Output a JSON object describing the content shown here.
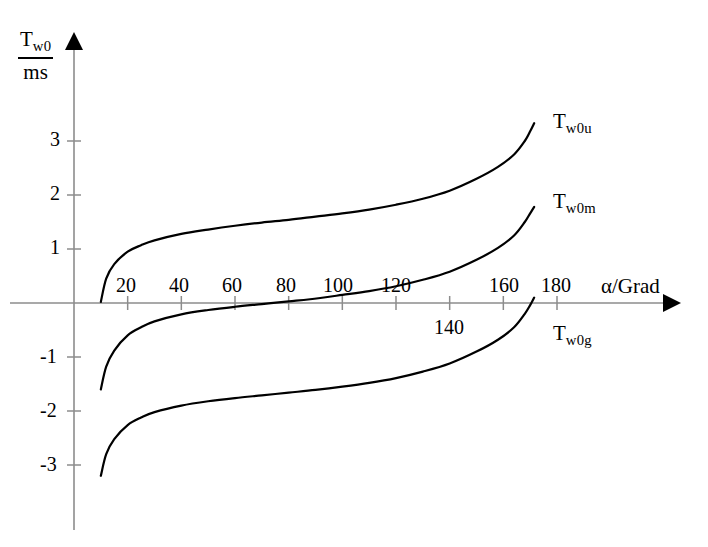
{
  "chart_data": {
    "type": "line",
    "title": "",
    "xlabel": "α/Grad",
    "ylabel_numerator": "T",
    "ylabel_numerator_sub": "w0",
    "ylabel_denominator": "ms",
    "ylabel": "T_w0 / ms",
    "xlim": [
      0,
      190
    ],
    "ylim": [
      -3.6,
      3.8
    ],
    "grid": false,
    "legend_position": "right-inline",
    "x_ticks": [
      20,
      40,
      60,
      80,
      100,
      120,
      140,
      160,
      180
    ],
    "x_tick_labels": [
      "20",
      "40",
      "60",
      "80",
      "100",
      "120",
      "140",
      "160",
      "180"
    ],
    "x_tick_label_below_axis": [
      false,
      false,
      false,
      false,
      false,
      false,
      true,
      false,
      false
    ],
    "y_ticks": [
      3,
      2,
      1,
      -1,
      -2,
      -3
    ],
    "y_tick_labels": [
      "3",
      "2",
      "1",
      "-1",
      "-2",
      "-3"
    ],
    "series": [
      {
        "name": "T_w0u",
        "label_base": "T",
        "label_sub": "w0u",
        "color": "#000000",
        "x": [
          10,
          12,
          15,
          20,
          25,
          30,
          40,
          50,
          60,
          70,
          80,
          90,
          100,
          110,
          120,
          130,
          140,
          150,
          158,
          164,
          168,
          170,
          171.5
        ],
        "y": [
          0.02,
          0.45,
          0.72,
          0.95,
          1.07,
          1.16,
          1.28,
          1.36,
          1.43,
          1.49,
          1.54,
          1.6,
          1.66,
          1.73,
          1.82,
          1.93,
          2.08,
          2.3,
          2.52,
          2.75,
          3.0,
          3.18,
          3.33
        ]
      },
      {
        "name": "T_w0m",
        "label_base": "T",
        "label_sub": "w0m",
        "color": "#000000",
        "x": [
          10,
          12,
          15,
          20,
          25,
          30,
          40,
          50,
          60,
          70,
          80,
          88,
          100,
          110,
          120,
          130,
          140,
          150,
          158,
          164,
          168,
          170,
          171.5
        ],
        "y": [
          -1.6,
          -1.18,
          -0.88,
          -0.6,
          -0.45,
          -0.34,
          -0.21,
          -0.13,
          -0.07,
          -0.02,
          0.03,
          0.07,
          0.15,
          0.22,
          0.31,
          0.43,
          0.58,
          0.8,
          1.02,
          1.25,
          1.5,
          1.66,
          1.78
        ]
      },
      {
        "name": "T_w0g",
        "label_base": "T",
        "label_sub": "w0g",
        "color": "#000000",
        "x": [
          10,
          12,
          15,
          20,
          25,
          30,
          40,
          50,
          60,
          70,
          80,
          90,
          100,
          110,
          120,
          130,
          140,
          150,
          158,
          164,
          168,
          170,
          171.5
        ],
        "y": [
          -3.2,
          -2.8,
          -2.52,
          -2.26,
          -2.12,
          -2.02,
          -1.9,
          -1.82,
          -1.76,
          -1.71,
          -1.66,
          -1.61,
          -1.55,
          -1.48,
          -1.39,
          -1.27,
          -1.12,
          -0.9,
          -0.68,
          -0.45,
          -0.2,
          -0.04,
          0.1
        ]
      }
    ],
    "annotations": []
  },
  "axes": {
    "x_axis_arrow": true,
    "y_axis_arrow": true
  }
}
